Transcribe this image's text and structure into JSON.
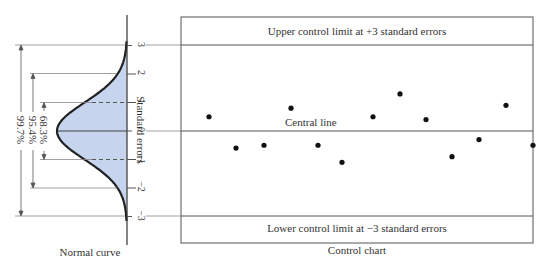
{
  "normal_curve": {
    "caption": "Normal curve",
    "axis_label": "Standard errors",
    "ticks": [
      "3",
      "2",
      "1",
      "0",
      "−1",
      "−2",
      "−3"
    ],
    "bands": [
      {
        "label": "99.7%",
        "range": "±3"
      },
      {
        "label": "95.4%",
        "range": "±2"
      },
      {
        "label": "68.3%",
        "range": "±1"
      }
    ],
    "fill_color": "#c6d4ee",
    "curve_color": "#222222"
  },
  "control_chart": {
    "caption": "Control chart",
    "ucl_label": "Upper control limit at +3 standard errors",
    "central_label": "Central line",
    "lcl_label": "Lower control limit at −3 standard errors"
  },
  "chart_data": {
    "type": "scatter",
    "title": "Control chart",
    "xlabel": "",
    "ylabel": "Standard errors",
    "ylim": [
      -3,
      3
    ],
    "reference_lines": [
      {
        "y": 3,
        "label": "Upper control limit at +3 standard errors"
      },
      {
        "y": 0,
        "label": "Central line"
      },
      {
        "y": -3,
        "label": "Lower control limit at −3 standard errors"
      }
    ],
    "x": [
      1,
      2,
      3,
      4,
      5,
      6,
      7,
      8,
      9,
      10,
      11,
      12,
      13
    ],
    "values": [
      0.5,
      -0.6,
      -0.5,
      0.8,
      -0.5,
      -1.1,
      0.5,
      1.3,
      0.4,
      -0.9,
      -0.3,
      0.9,
      -0.5
    ]
  }
}
